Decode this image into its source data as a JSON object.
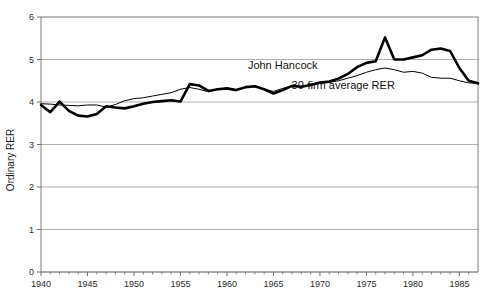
{
  "chart_data": {
    "type": "line",
    "title": "",
    "xlabel": "",
    "ylabel": "Ordinary RER",
    "xlim": [
      1940,
      1987
    ],
    "ylim": [
      0,
      6
    ],
    "xticks": [
      1940,
      1945,
      1950,
      1955,
      1960,
      1965,
      1970,
      1975,
      1980,
      1985
    ],
    "xtick_labels": [
      "1940",
      "1945",
      "1950",
      "1955",
      "1960",
      "1965",
      "1970",
      "1975",
      "1980",
      "1985"
    ],
    "yticks": [
      0,
      1,
      2,
      3,
      4,
      5,
      6
    ],
    "ytick_labels": [
      "0",
      "1",
      "2",
      "3",
      "4",
      "5",
      "6"
    ],
    "minor_xticks_every": 1,
    "grid": "horizontal",
    "legend": "inline-annotations",
    "x": [
      1940,
      1941,
      1942,
      1943,
      1944,
      1945,
      1946,
      1947,
      1948,
      1949,
      1950,
      1951,
      1952,
      1953,
      1954,
      1955,
      1956,
      1957,
      1958,
      1959,
      1960,
      1961,
      1962,
      1963,
      1964,
      1965,
      1966,
      1967,
      1968,
      1969,
      1970,
      1971,
      1972,
      1973,
      1974,
      1975,
      1976,
      1977,
      1978,
      1979,
      1980,
      1981,
      1982,
      1983,
      1984,
      1985,
      1986,
      1987
    ],
    "series": [
      {
        "name": "John Hancock",
        "stroke": "#000000",
        "width": 2.6,
        "label_x": 1966.0,
        "label_y": 4.78,
        "values": [
          3.93,
          3.76,
          4.01,
          3.79,
          3.68,
          3.66,
          3.72,
          3.9,
          3.87,
          3.85,
          3.9,
          3.96,
          4.0,
          4.02,
          4.04,
          4.01,
          4.42,
          4.39,
          4.26,
          4.3,
          4.32,
          4.28,
          4.35,
          4.37,
          4.3,
          4.2,
          4.28,
          4.38,
          4.36,
          4.4,
          4.46,
          4.48,
          4.55,
          4.66,
          4.82,
          4.92,
          4.96,
          5.52,
          5.0,
          5.0,
          5.05,
          5.1,
          5.23,
          5.26,
          5.2,
          4.8,
          4.5,
          4.44
        ]
      },
      {
        "name": "30-firm average RER",
        "stroke": "#000000",
        "width": 1.0,
        "label_x": 1972.5,
        "label_y": 4.3,
        "values": [
          3.96,
          3.95,
          3.93,
          3.92,
          3.91,
          3.93,
          3.93,
          3.88,
          3.94,
          4.03,
          4.08,
          4.1,
          4.14,
          4.18,
          4.22,
          4.3,
          4.34,
          4.3,
          4.24,
          4.3,
          4.32,
          4.28,
          4.34,
          4.36,
          4.3,
          4.25,
          4.32,
          4.38,
          4.36,
          4.4,
          4.44,
          4.46,
          4.5,
          4.56,
          4.62,
          4.7,
          4.76,
          4.8,
          4.76,
          4.7,
          4.72,
          4.68,
          4.58,
          4.56,
          4.56,
          4.5,
          4.45,
          4.44
        ]
      }
    ]
  },
  "axis": {
    "y_title": "Ordinary RER"
  }
}
